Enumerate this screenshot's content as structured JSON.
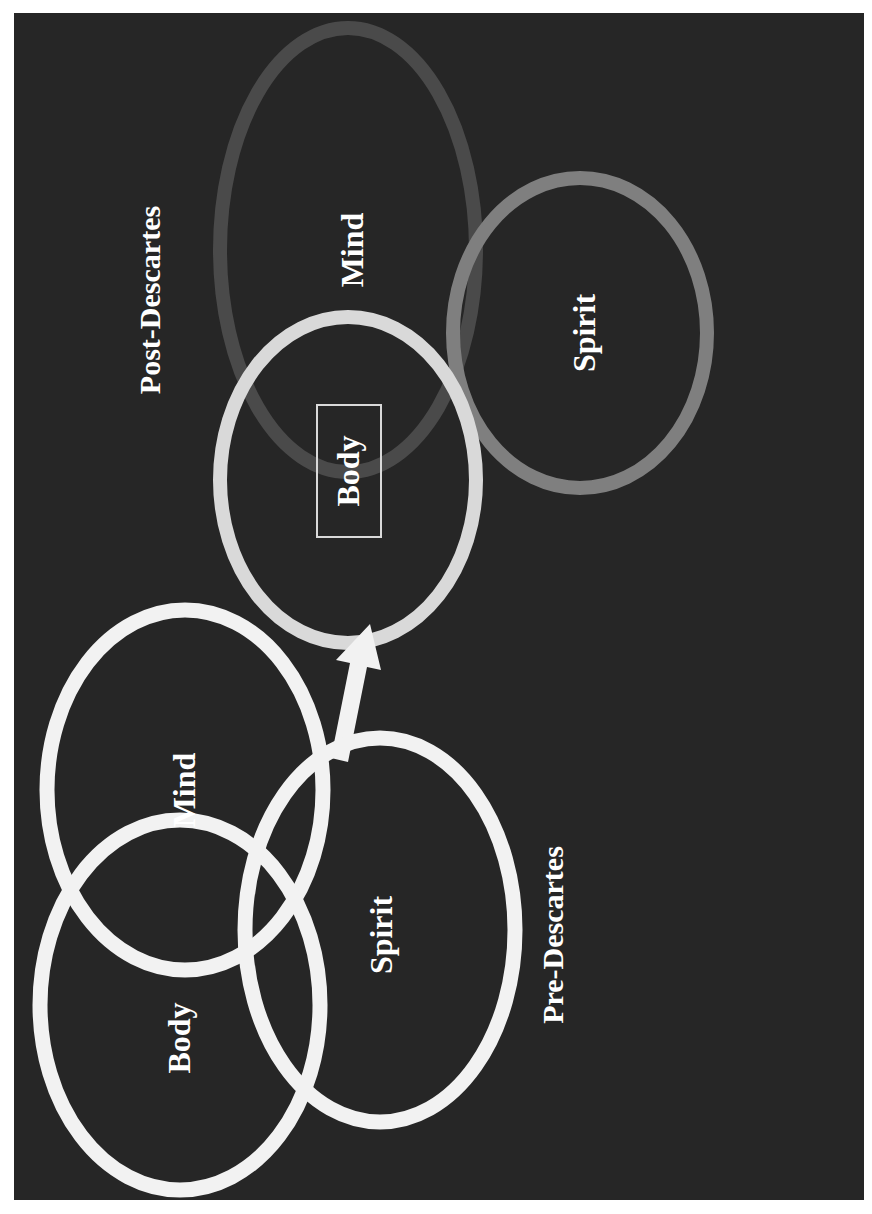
{
  "slide": {
    "orientation": "rotated-90-ccw",
    "background": "#262626",
    "page_background": "#ffffff"
  },
  "post_descartes": {
    "title": "Post-Descartes",
    "circles": [
      {
        "label": "Mind",
        "ring_color": "#4a4a4a"
      },
      {
        "label": "Spirit",
        "ring_color": "#7f7f7f"
      },
      {
        "label": "Body",
        "ring_color": "#d9d9d9",
        "boxed": true
      }
    ]
  },
  "pre_descartes": {
    "title": "Pre-Descartes",
    "circles": [
      {
        "label": "Mind",
        "ring_color": "#f2f2f2"
      },
      {
        "label": "Body",
        "ring_color": "#f2f2f2"
      },
      {
        "label": "Spirit",
        "ring_color": "#f2f2f2"
      }
    ]
  },
  "arrow": {
    "from": "pre_descartes",
    "to": "post_descartes.Body",
    "color": "#f2f2f2"
  }
}
